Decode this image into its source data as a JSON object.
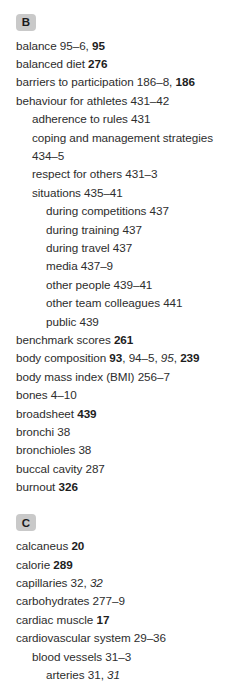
{
  "page": {
    "top_clipped_text": "",
    "background_color": "#ffffff",
    "text_color": "#2d2d2d",
    "badge_color": "#c9c9c9"
  },
  "index": {
    "groups": [
      {
        "letter": "B",
        "entries": [
          {
            "level": 0,
            "parts": [
              {
                "t": "balance 95–6, ",
                "s": "plain"
              },
              {
                "t": "95",
                "s": "bold"
              }
            ]
          },
          {
            "level": 0,
            "parts": [
              {
                "t": "balanced diet ",
                "s": "plain"
              },
              {
                "t": "276",
                "s": "bold"
              }
            ]
          },
          {
            "level": 0,
            "parts": [
              {
                "t": "barriers to participation 186–8, ",
                "s": "plain"
              },
              {
                "t": "186",
                "s": "bold"
              }
            ]
          },
          {
            "level": 0,
            "parts": [
              {
                "t": "behaviour for athletes 431–42",
                "s": "plain"
              }
            ]
          },
          {
            "level": 1,
            "parts": [
              {
                "t": "adherence to rules 431",
                "s": "plain"
              }
            ]
          },
          {
            "level": 1,
            "parts": [
              {
                "t": "coping and management strategies 434–5",
                "s": "plain"
              }
            ]
          },
          {
            "level": 1,
            "parts": [
              {
                "t": "respect for others 431–3",
                "s": "plain"
              }
            ]
          },
          {
            "level": 1,
            "parts": [
              {
                "t": "situations 435–41",
                "s": "plain"
              }
            ]
          },
          {
            "level": 2,
            "parts": [
              {
                "t": "during competitions 437",
                "s": "plain"
              }
            ]
          },
          {
            "level": 2,
            "parts": [
              {
                "t": "during training 437",
                "s": "plain"
              }
            ]
          },
          {
            "level": 2,
            "parts": [
              {
                "t": "during travel 437",
                "s": "plain"
              }
            ]
          },
          {
            "level": 2,
            "parts": [
              {
                "t": "media 437–9",
                "s": "plain"
              }
            ]
          },
          {
            "level": 2,
            "parts": [
              {
                "t": "other people 439–41",
                "s": "plain"
              }
            ]
          },
          {
            "level": 2,
            "parts": [
              {
                "t": "other team colleagues 441",
                "s": "plain"
              }
            ]
          },
          {
            "level": 2,
            "parts": [
              {
                "t": "public 439",
                "s": "plain"
              }
            ]
          },
          {
            "level": 0,
            "parts": [
              {
                "t": "benchmark scores ",
                "s": "plain"
              },
              {
                "t": "261",
                "s": "bold"
              }
            ]
          },
          {
            "level": 0,
            "parts": [
              {
                "t": "body composition ",
                "s": "plain"
              },
              {
                "t": "93",
                "s": "bold"
              },
              {
                "t": ", 94–5, ",
                "s": "plain"
              },
              {
                "t": "95",
                "s": "italic"
              },
              {
                "t": ", ",
                "s": "plain"
              },
              {
                "t": "239",
                "s": "bold"
              }
            ]
          },
          {
            "level": 0,
            "parts": [
              {
                "t": "body mass index (BMI) 256–7",
                "s": "plain"
              }
            ]
          },
          {
            "level": 0,
            "parts": [
              {
                "t": "bones 4–10",
                "s": "plain"
              }
            ]
          },
          {
            "level": 0,
            "parts": [
              {
                "t": "broadsheet ",
                "s": "plain"
              },
              {
                "t": "439",
                "s": "bold"
              }
            ]
          },
          {
            "level": 0,
            "parts": [
              {
                "t": "bronchi 38",
                "s": "plain"
              }
            ]
          },
          {
            "level": 0,
            "parts": [
              {
                "t": "bronchioles 38",
                "s": "plain"
              }
            ]
          },
          {
            "level": 0,
            "parts": [
              {
                "t": "buccal cavity 287",
                "s": "plain"
              }
            ]
          },
          {
            "level": 0,
            "parts": [
              {
                "t": "burnout ",
                "s": "plain"
              },
              {
                "t": "326",
                "s": "bold"
              }
            ]
          }
        ]
      },
      {
        "letter": "C",
        "entries": [
          {
            "level": 0,
            "parts": [
              {
                "t": "calcaneus ",
                "s": "plain"
              },
              {
                "t": "20",
                "s": "bold"
              }
            ]
          },
          {
            "level": 0,
            "parts": [
              {
                "t": "calorie ",
                "s": "plain"
              },
              {
                "t": "289",
                "s": "bold"
              }
            ]
          },
          {
            "level": 0,
            "parts": [
              {
                "t": "capillaries 32, ",
                "s": "plain"
              },
              {
                "t": "32",
                "s": "italic"
              }
            ]
          },
          {
            "level": 0,
            "parts": [
              {
                "t": "carbohydrates 277–9",
                "s": "plain"
              }
            ]
          },
          {
            "level": 0,
            "parts": [
              {
                "t": "cardiac muscle ",
                "s": "plain"
              },
              {
                "t": "17",
                "s": "bold"
              }
            ]
          },
          {
            "level": 0,
            "parts": [
              {
                "t": "cardiovascular system 29–36",
                "s": "plain"
              }
            ]
          },
          {
            "level": 1,
            "parts": [
              {
                "t": "blood vessels 31–3",
                "s": "plain"
              }
            ]
          },
          {
            "level": 2,
            "parts": [
              {
                "t": "arteries 31, ",
                "s": "plain"
              },
              {
                "t": "31",
                "s": "italic"
              }
            ]
          }
        ]
      }
    ]
  }
}
